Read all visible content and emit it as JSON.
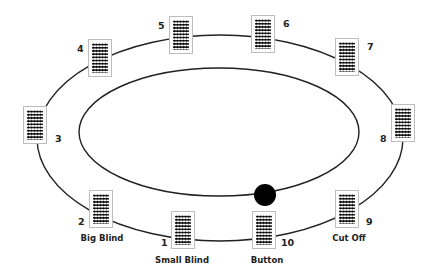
{
  "diagram": {
    "type": "poker-table-seating",
    "seats": [
      {
        "number": "1",
        "position": "Small Blind"
      },
      {
        "number": "2",
        "position": "Big Blind"
      },
      {
        "number": "3",
        "position": ""
      },
      {
        "number": "4",
        "position": ""
      },
      {
        "number": "5",
        "position": ""
      },
      {
        "number": "6",
        "position": ""
      },
      {
        "number": "7",
        "position": ""
      },
      {
        "number": "8",
        "position": ""
      },
      {
        "number": "9",
        "position": "Cut Off"
      },
      {
        "number": "10",
        "position": "Button"
      }
    ],
    "dealer_button": "filled black circle near seat 10"
  },
  "colors": {
    "line": "#222222",
    "card_border": "#bdbdbd",
    "pattern": "#000000",
    "background": "#ffffff"
  }
}
